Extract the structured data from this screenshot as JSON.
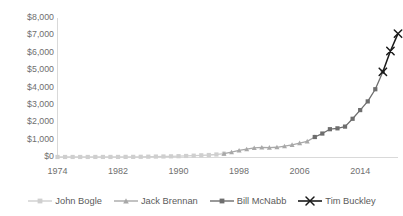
{
  "title": "",
  "axis": {
    "y_ticks": [
      "$8,000",
      "$7,000",
      "$6,000",
      "$5,000",
      "$4,000",
      "$3,000",
      "$2,000",
      "$1,000",
      "$0"
    ],
    "x_ticks": [
      "1974",
      "1982",
      "1990",
      "1998",
      "2006",
      "2014"
    ]
  },
  "legend": {
    "items": [
      {
        "label": "John Bogle",
        "color": "#cfcfcf",
        "marker": "diamond-marker"
      },
      {
        "label": "Jack Brennan",
        "color": "#a8a8a8",
        "marker": "triangle-marker"
      },
      {
        "label": "Bill McNabb",
        "color": "#6e6e6e",
        "marker": "square-marker"
      },
      {
        "label": "Tim Buckley",
        "color": "#1a1a1a",
        "marker": "x-marker"
      }
    ]
  },
  "chart_data": {
    "type": "line",
    "title": "",
    "xlabel": "",
    "ylabel": "",
    "xlim": [
      1974,
      2019
    ],
    "ylim": [
      0,
      8000
    ],
    "y_tick_values": [
      0,
      1000,
      2000,
      3000,
      4000,
      5000,
      6000,
      7000,
      8000
    ],
    "x_tick_values": [
      1974,
      1982,
      1990,
      1998,
      2006,
      2014
    ],
    "y_tick_labels": [
      "$0",
      "$1,000",
      "$2,000",
      "$3,000",
      "$4,000",
      "$5,000",
      "$6,000",
      "$7,000",
      "$8,000"
    ],
    "grid": false,
    "legend_position": "bottom",
    "series": [
      {
        "name": "John Bogle",
        "color": "#cfcfcf",
        "marker": "diamond",
        "x": [
          1974,
          1975,
          1976,
          1977,
          1978,
          1979,
          1980,
          1981,
          1982,
          1983,
          1984,
          1985,
          1986,
          1987,
          1988,
          1989,
          1990,
          1991,
          1992,
          1993,
          1994,
          1995,
          1996
        ],
        "y": [
          1.4,
          1.5,
          1.8,
          2.0,
          2.2,
          2.5,
          3.0,
          3.5,
          4.5,
          6.0,
          8.0,
          12.0,
          18.0,
          25.0,
          30.0,
          38.0,
          47.0,
          59.0,
          77.0,
          98.0,
          115.0,
          145.0,
          190.0
        ]
      },
      {
        "name": "Jack Brennan",
        "color": "#a8a8a8",
        "marker": "triangle",
        "x": [
          1996,
          1997,
          1998,
          1999,
          2000,
          2001,
          2002,
          2003,
          2004,
          2005,
          2006,
          2007,
          2008
        ],
        "y": [
          190.0,
          280.0,
          380.0,
          450.0,
          520.0,
          550.0,
          540.0,
          560.0,
          620.0,
          700.0,
          800.0,
          900.0,
          1150.0
        ]
      },
      {
        "name": "Bill McNabb",
        "color": "#6e6e6e",
        "marker": "square",
        "x": [
          2008,
          2009,
          2010,
          2011,
          2012,
          2013,
          2014,
          2015,
          2016,
          2017
        ],
        "y": [
          1150.0,
          1350.0,
          1600.0,
          1650.0,
          1750.0,
          2200.0,
          2700.0,
          3200.0,
          3900.0,
          4900.0
        ]
      },
      {
        "name": "Tim Buckley",
        "color": "#1a1a1a",
        "marker": "x",
        "x": [
          2017,
          2018,
          2019
        ],
        "y": [
          4900.0,
          6100.0,
          7100.0
        ]
      }
    ]
  }
}
